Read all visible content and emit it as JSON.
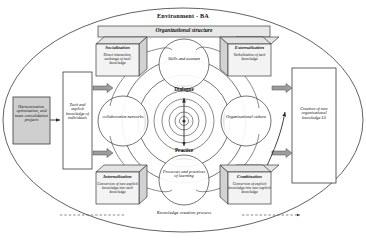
{
  "diagram": {
    "title": "Environment - BA",
    "organizational_structure": "Organizational structure",
    "bottom_caption": "Knowledge creation process",
    "colors": {
      "outline": "#3a3a3a",
      "cube_fill": "#e3e3e3",
      "panel_fill": "#cfcfcf",
      "arrow_fill": "#9c9c9c",
      "petal_fill": "#ffffff",
      "shade_fill": "#d6d6d6"
    }
  },
  "seci": {
    "socialization": {
      "title": "Socialization",
      "body": "Direct interaction, exchange of tacit knowledge"
    },
    "externalization": {
      "title": "Externalization",
      "body": "Verbalization of tacit knowledge"
    },
    "internalization": {
      "title": "Internalization",
      "body": "Conversion of new explicit knowledge into tacit knowledge"
    },
    "combination": {
      "title": "Combination",
      "body": "Conversion of explicit knowledge into new explicit knowledge"
    }
  },
  "panels": {
    "left_outer": "Harmonization, optimization, and team consolidation projects",
    "left_inner": "Tacit and explicit knowledge of individuals",
    "right_outer": "Creation of new organizational knowledge LS"
  },
  "petals": {
    "top": "Skills and acumen",
    "left": "collaboration networks",
    "right": "Organizational culture",
    "bottom": "Processes and practices of learning"
  },
  "core": {
    "top": "Dialogue",
    "bottom": "Practice"
  }
}
